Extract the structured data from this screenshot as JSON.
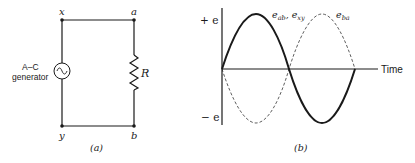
{
  "figure_a": {
    "caption": "(a)",
    "nodes": {
      "x": "x",
      "a": "a",
      "y": "y",
      "b": "b"
    },
    "generator_label_line1": "A–C",
    "generator_label_line2": "generator",
    "resistor_label": "R"
  },
  "figure_b": {
    "caption": "(b)",
    "y_axis_top": "+ e",
    "y_axis_bottom": "− e",
    "x_axis_label": "Time",
    "solid_curve_label": "e",
    "solid_curve_sub1": "ab",
    "solid_curve_sep": ", e",
    "solid_curve_sub2": "xy",
    "dashed_curve_label": "e",
    "dashed_curve_sub": "ba"
  },
  "colors": {
    "ink": "#1a1a1a",
    "background": "#ffffff"
  }
}
